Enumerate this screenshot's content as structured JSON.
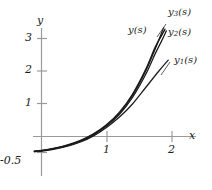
{
  "chart_data": {
    "type": "line",
    "title": "",
    "xlabel": "x",
    "ylabel": "y",
    "xlim": [
      -0.11,
      2.25
    ],
    "ylim": [
      -0.62,
      3.55
    ],
    "xticks": [
      1,
      2
    ],
    "xtick_labels": [
      "1",
      "2"
    ],
    "yticks": [
      -0.5,
      1,
      2,
      3
    ],
    "ytick_labels": [
      "-0.5",
      "1",
      "2",
      "3"
    ],
    "grid": false,
    "legend": "inline-labels",
    "axis_color": "#9a9a9a",
    "curve_color": "#1a1a1a",
    "series": [
      {
        "name": "y(s)",
        "label": "y(s)",
        "label_base": "y",
        "label_sub": "",
        "label_tail": "(s)",
        "x": [
          -0.11,
          0.0,
          0.2,
          0.4,
          0.6,
          0.8,
          1.0,
          1.2,
          1.4,
          1.6,
          1.75,
          1.85,
          1.9
        ],
        "y": [
          -0.45,
          -0.43,
          -0.36,
          -0.26,
          -0.12,
          0.08,
          0.36,
          0.75,
          1.3,
          2.05,
          2.75,
          3.12,
          3.3
        ]
      },
      {
        "name": "y1(s)",
        "label": "y1(s)",
        "label_base": "y",
        "label_sub": "1",
        "label_tail": "(s)",
        "x": [
          -0.11,
          0.0,
          0.2,
          0.4,
          0.6,
          0.8,
          1.0,
          1.2,
          1.4,
          1.6,
          1.8,
          1.95
        ],
        "y": [
          -0.47,
          -0.45,
          -0.39,
          -0.3,
          -0.17,
          0.02,
          0.28,
          0.6,
          1.0,
          1.5,
          2.0,
          2.35
        ]
      },
      {
        "name": "y2(s)",
        "label": "y2(s)",
        "label_base": "y",
        "label_sub": "2",
        "label_tail": "(s)",
        "x": [
          -0.11,
          0.0,
          0.2,
          0.4,
          0.6,
          0.8,
          1.0,
          1.2,
          1.4,
          1.6,
          1.75,
          1.85,
          1.92
        ],
        "y": [
          -0.46,
          -0.44,
          -0.375,
          -0.28,
          -0.145,
          0.05,
          0.32,
          0.68,
          1.2,
          1.9,
          2.55,
          2.95,
          3.25
        ]
      },
      {
        "name": "y3(s)",
        "label": "y3(s)",
        "label_base": "y",
        "label_sub": "3",
        "label_tail": "(s)",
        "x": [
          -0.11,
          0.0,
          0.2,
          0.4,
          0.6,
          0.8,
          1.0,
          1.2,
          1.4,
          1.6,
          1.75,
          1.83,
          1.88
        ],
        "y": [
          -0.455,
          -0.435,
          -0.365,
          -0.27,
          -0.13,
          0.07,
          0.34,
          0.72,
          1.26,
          2.0,
          2.7,
          3.1,
          3.35
        ]
      }
    ],
    "annotations": [
      {
        "text": "y3(s)",
        "role": "curve-label-y3",
        "has_leader": true
      },
      {
        "text": "y(s)",
        "role": "curve-label-y",
        "has_leader": false
      },
      {
        "text": "y2(s)",
        "role": "curve-label-y2",
        "has_leader": false
      },
      {
        "text": "y1(s)",
        "role": "curve-label-y1",
        "has_leader": true
      }
    ]
  }
}
